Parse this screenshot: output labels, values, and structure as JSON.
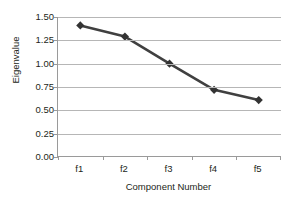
{
  "chart_data": {
    "type": "line",
    "title": "",
    "subtitle": "",
    "xlabel": "Component Number",
    "ylabel": "Eigenvalue",
    "categories": [
      "f1",
      "f2",
      "f3",
      "f4",
      "f5"
    ],
    "values": [
      1.41,
      1.29,
      1.0,
      0.72,
      0.61
    ],
    "series": [
      {
        "name": "Eigenvalue",
        "values": [
          1.41,
          1.29,
          1.0,
          0.72,
          0.61
        ],
        "color": "#404040",
        "marker": "diamond"
      }
    ],
    "ylim": [
      0.0,
      1.5
    ],
    "ytick_labels": [
      "1.50",
      "1.25",
      "1.00",
      "0.75",
      "0.50",
      "0.25",
      "0.00"
    ],
    "ytick_values": [
      1.5,
      1.25,
      1.0,
      0.75,
      0.5,
      0.25,
      0.0
    ],
    "grid": true,
    "grid_axis": "y",
    "legend": false,
    "legend_position": "none",
    "annotations": [],
    "colors": {
      "line": "#404040",
      "marker": "#333333",
      "gridline": "#b6b6b6",
      "axis": "#9a9a9a",
      "text": "#231f20",
      "background": "#ffffff"
    }
  }
}
